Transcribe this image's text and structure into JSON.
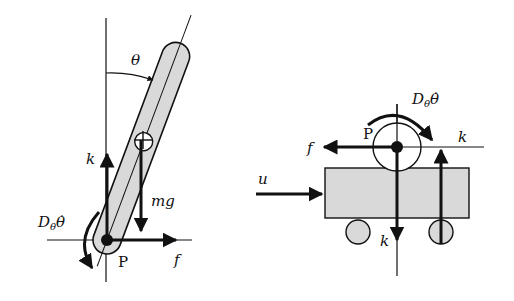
{
  "diagram": {
    "left_panel": {
      "labels": {
        "theta": "θ",
        "k": "k",
        "mg": "mg",
        "f": "f",
        "P": "P",
        "damping_D": "D",
        "damping_sub": "θ",
        "damping_dot": "θ̇"
      }
    },
    "right_panel": {
      "labels": {
        "P": "P",
        "f": "f",
        "k_top": "k",
        "k_bottom": "k",
        "u": "u",
        "damping_D": "D",
        "damping_sub": "θ",
        "damping_dot": "θ̇"
      }
    },
    "colors": {
      "stroke": "#111111",
      "fill_gray": "#d9d9d9"
    }
  }
}
